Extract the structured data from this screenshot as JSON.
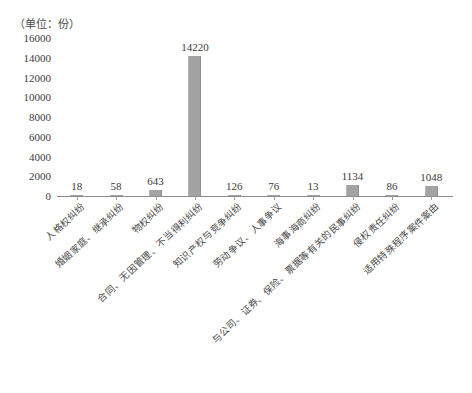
{
  "chart_data": {
    "type": "bar",
    "title": "",
    "subtitle": "",
    "unit_caption": "（单位：份）",
    "xlabel": "",
    "ylabel": "",
    "ylim": [
      0,
      16000
    ],
    "grid": false,
    "legend": null,
    "bar_color": "#a3a3a3",
    "axis_color": "#8c8c8c",
    "y_ticks": [
      0,
      2000,
      4000,
      6000,
      8000,
      10000,
      12000,
      14000,
      16000
    ],
    "y_tick_labels": [
      "0",
      "2000",
      "4000",
      "6000",
      "8000",
      "10000",
      "12000",
      "14000",
      "16000"
    ],
    "categories": [
      "人格权纠纷",
      "婚姻家庭、继承纠纷",
      "物权纠纷",
      "合同、无因管理、不当得利纠纷",
      "知识产权与竞争纠纷",
      "劳动争议、人事争议",
      "海事海商纠纷",
      "与公司、证券、保险、票据等有关的民事纠纷",
      "侵权责任纠纷",
      "适用特殊程序案件案由"
    ],
    "values": [
      18,
      58,
      643,
      14220,
      126,
      76,
      13,
      1134,
      86,
      1048
    ],
    "value_labels": [
      "18",
      "58",
      "643",
      "14220",
      "126",
      "76",
      "13",
      "1134",
      "86",
      "1048"
    ]
  }
}
